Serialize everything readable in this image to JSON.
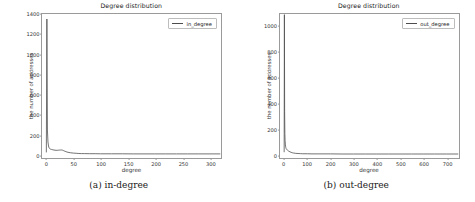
{
  "figure": {
    "subfigures": [
      {
        "caption": "(a) in-degree",
        "title": "Degree distribution",
        "xlabel": "degree",
        "ylabel": "the number of addresses",
        "legend_label": "in_degree",
        "line_color": "#4d4d4d"
      },
      {
        "caption": "(b) out-degree",
        "title": "Degree distribution",
        "xlabel": "degree",
        "ylabel": "the number of addresses",
        "legend_label": "out_degree",
        "line_color": "#4d4d4d"
      }
    ]
  },
  "chart_data": [
    {
      "type": "line",
      "title": "Degree distribution",
      "xlabel": "degree",
      "ylabel": "the number of addresses",
      "legend": [
        "in_degree"
      ],
      "legend_position": "upper right",
      "grid": false,
      "xlim": [
        -8,
        322
      ],
      "ylim": [
        -40,
        1400
      ],
      "xticks": [
        0,
        50,
        100,
        150,
        200,
        250,
        300
      ],
      "yticks": [
        0,
        200,
        400,
        600,
        800,
        1000,
        1200,
        1400
      ],
      "series": [
        {
          "name": "in_degree",
          "x": [
            0,
            1,
            2,
            3,
            4,
            5,
            6,
            7,
            8,
            9,
            10,
            12,
            14,
            16,
            18,
            20,
            22,
            24,
            26,
            28,
            30,
            32,
            34,
            36,
            38,
            40,
            45,
            50,
            55,
            60,
            65,
            70,
            80,
            90,
            100,
            120,
            140,
            160,
            180,
            200,
            220,
            240,
            260,
            280,
            300,
            320
          ],
          "values": [
            20,
            1350,
            240,
            120,
            80,
            62,
            55,
            50,
            48,
            46,
            45,
            42,
            40,
            38,
            37,
            37,
            38,
            39,
            40,
            40,
            38,
            33,
            28,
            24,
            20,
            17,
            12,
            9,
            7,
            5,
            4,
            4,
            3,
            3,
            2,
            2,
            2,
            1,
            1,
            1,
            1,
            1,
            1,
            1,
            1,
            1
          ]
        }
      ]
    },
    {
      "type": "line",
      "title": "Degree distribution",
      "xlabel": "degree",
      "ylabel": "the number of addresses",
      "legend": [
        "out_degree"
      ],
      "legend_position": "upper right",
      "grid": false,
      "xlim": [
        -18,
        755
      ],
      "ylim": [
        -30,
        1090
      ],
      "xticks": [
        0,
        100,
        200,
        300,
        400,
        500,
        600,
        700
      ],
      "yticks": [
        0,
        200,
        400,
        600,
        800,
        1000
      ],
      "series": [
        {
          "name": "out_degree",
          "x": [
            0,
            1,
            2,
            3,
            4,
            5,
            6,
            7,
            8,
            9,
            10,
            12,
            14,
            16,
            18,
            20,
            25,
            30,
            35,
            40,
            50,
            60,
            70,
            80,
            100,
            120,
            150,
            200,
            250,
            300,
            350,
            400,
            450,
            500,
            550,
            600,
            650,
            700,
            750
          ],
          "values": [
            18,
            1085,
            330,
            160,
            105,
            78,
            62,
            52,
            46,
            42,
            40,
            35,
            31,
            28,
            25,
            23,
            18,
            14,
            11,
            9,
            6,
            5,
            4,
            3,
            3,
            2,
            2,
            2,
            1,
            1,
            1,
            1,
            1,
            1,
            1,
            1,
            1,
            1,
            1
          ]
        }
      ]
    }
  ]
}
